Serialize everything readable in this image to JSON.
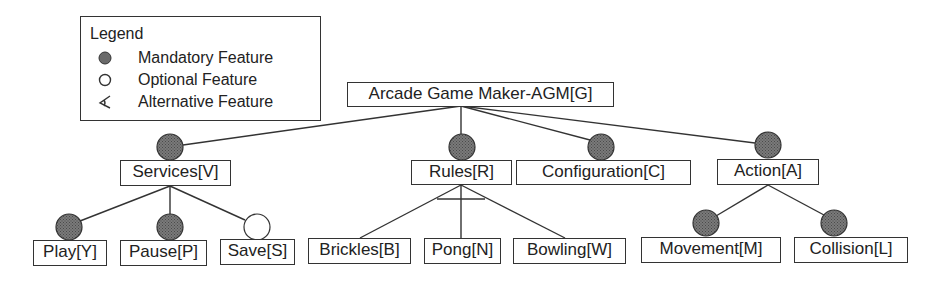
{
  "legend": {
    "title": "Legend",
    "items": [
      {
        "symbol": "filled-circle",
        "label": "Mandatory Feature"
      },
      {
        "symbol": "empty-circle",
        "label": "Optional Feature"
      },
      {
        "symbol": "alternative-arc",
        "label": "Alternative Feature"
      }
    ]
  },
  "colors": {
    "mandatory_fill": "#666666",
    "line": "#333333",
    "optional_fill": "#ffffff"
  },
  "root": {
    "label": "Arcade Game Maker-AGM[G]"
  },
  "features": {
    "services": {
      "label": "Services[V]",
      "type": "mandatory"
    },
    "rules": {
      "label": "Rules[R]",
      "type": "mandatory"
    },
    "configuration": {
      "label": "Configuration[C]",
      "type": "mandatory"
    },
    "action": {
      "label": "Action[A]",
      "type": "mandatory"
    },
    "play": {
      "label": "Play[Y]",
      "type": "mandatory",
      "parent": "Services[V]"
    },
    "pause": {
      "label": "Pause[P]",
      "type": "mandatory",
      "parent": "Services[V]"
    },
    "save": {
      "label": "Save[S]",
      "type": "optional",
      "parent": "Services[V]"
    },
    "brickles": {
      "label": "Brickles[B]",
      "type": "alternative",
      "parent": "Rules[R]"
    },
    "pong": {
      "label": "Pong[N]",
      "type": "alternative",
      "parent": "Rules[R]"
    },
    "bowling": {
      "label": "Bowling[W]",
      "type": "alternative",
      "parent": "Rules[R]"
    },
    "movement": {
      "label": "Movement[M]",
      "type": "mandatory",
      "parent": "Action[A]"
    },
    "collision": {
      "label": "Collision[L]",
      "type": "mandatory",
      "parent": "Action[A]"
    }
  }
}
